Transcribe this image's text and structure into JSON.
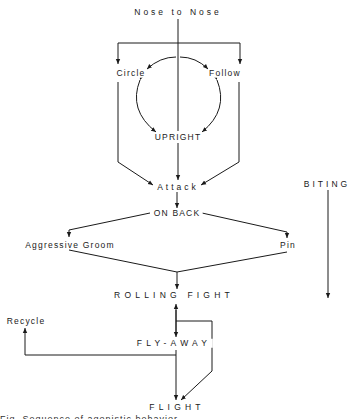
{
  "diagram": {
    "nodes": {
      "nose_to_nose": "Nose  to  Nose",
      "circle": "Circle",
      "follow": "Follow",
      "upright": "UPRIGHT",
      "attack": "Attack",
      "on_back": "ON BACK",
      "aggressive_groom": "Aggressive Groom",
      "pin": "Pin",
      "rolling_fight": "ROLLING  FIGHT",
      "recycle": "Recycle",
      "fly_away": "FLY-AWAY",
      "flight": "FLIGHT",
      "biting": "BITING"
    },
    "caption_cutoff": "Fig. Sequence of agonistic behavior ..."
  }
}
